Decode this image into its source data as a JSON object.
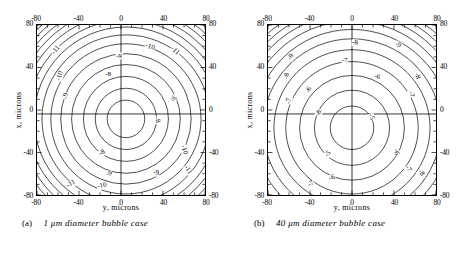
{
  "figure": {
    "panels": [
      {
        "id": "panel-a",
        "caption_tag": "(a)",
        "caption_text": "1 μm diameter bubble case",
        "axis": {
          "xlabel": "y, microns",
          "ylabel": "x, microns",
          "xticks": [
            "-80",
            "-40",
            "0",
            "40",
            "80"
          ],
          "yticks": [
            "80",
            "40",
            "0",
            "-40",
            "-80"
          ],
          "xlim": [
            -80,
            80
          ],
          "ylim": [
            -80,
            80
          ]
        },
        "contour_labels": [
          {
            "text": "-11",
            "x": -62,
            "y": 57,
            "rot": -50
          },
          {
            "text": "-10",
            "x": -58,
            "y": 33,
            "rot": -72
          },
          {
            "text": "-9",
            "x": -53,
            "y": 14,
            "rot": -80
          },
          {
            "text": "-9",
            "x": -3,
            "y": 51,
            "rot": 0
          },
          {
            "text": "-8",
            "x": -13,
            "y": 34,
            "rot": 0
          },
          {
            "text": "-10",
            "x": 26,
            "y": 60,
            "rot": 18
          },
          {
            "text": "-11",
            "x": 50,
            "y": 56,
            "rot": 42
          },
          {
            "text": "-6",
            "x": 48,
            "y": 12,
            "rot": 82
          },
          {
            "text": "-8",
            "x": 33,
            "y": -8,
            "rot": 75
          },
          {
            "text": "-8",
            "x": -19,
            "y": -39,
            "rot": -28
          },
          {
            "text": "-9",
            "x": -12,
            "y": -59,
            "rot": -10
          },
          {
            "text": "-9",
            "x": 32,
            "y": -58,
            "rot": 14
          },
          {
            "text": "-10",
            "x": 58,
            "y": -36,
            "rot": 70
          },
          {
            "text": "-11",
            "x": 62,
            "y": -55,
            "rot": 55
          },
          {
            "text": "-11",
            "x": -48,
            "y": -68,
            "rot": -28
          },
          {
            "text": "-10",
            "x": -19,
            "y": -70,
            "rot": -12
          }
        ],
        "chart_data": {
          "type": "contour",
          "title": "1 μm diameter bubble case",
          "xlabel": "y, microns",
          "ylabel": "x, microns",
          "xlim": [
            -80,
            80
          ],
          "ylim": [
            -80,
            80
          ],
          "levels": [
            -7,
            -8,
            -9,
            -10,
            -11,
            -12,
            -13,
            -14
          ],
          "labeled_levels": [
            -6,
            -8,
            -9,
            -10,
            -11
          ],
          "center": [
            5,
            -4
          ],
          "description": "Concentric near-circular closed contours of decreasing value outward, centered slightly right of and below the origin; contour lines bunch densely at the four corners.",
          "grid": false,
          "legend": "none"
        }
      },
      {
        "id": "panel-b",
        "caption_tag": "(b)",
        "caption_text": "40 μm diameter bubble case",
        "axis": {
          "xlabel": "y, microns",
          "ylabel": "x, microns",
          "xticks": [
            "-80",
            "-40",
            "0",
            "40",
            "80"
          ],
          "yticks": [
            "80",
            "40",
            "0",
            "-40",
            "-80"
          ],
          "xlim": [
            -80,
            80
          ],
          "ylim": [
            -80,
            80
          ]
        },
        "contour_labels": [
          {
            "text": "-9",
            "x": -58,
            "y": 50,
            "rot": -58
          },
          {
            "text": "-8",
            "x": -62,
            "y": 33,
            "rot": -74
          },
          {
            "text": "-7",
            "x": -60,
            "y": 9,
            "rot": -84
          },
          {
            "text": "-6",
            "x": -41,
            "y": 20,
            "rot": -62
          },
          {
            "text": "-8",
            "x": -32,
            "y": -2,
            "rot": -64
          },
          {
            "text": "-8",
            "x": 2,
            "y": 63,
            "rot": 5
          },
          {
            "text": "-7",
            "x": -8,
            "y": 47,
            "rot": 0
          },
          {
            "text": "-9",
            "x": 42,
            "y": 61,
            "rot": 28
          },
          {
            "text": "-6",
            "x": 23,
            "y": 32,
            "rot": 18
          },
          {
            "text": "-8",
            "x": 60,
            "y": 33,
            "rot": 72
          },
          {
            "text": "-7",
            "x": 55,
            "y": 16,
            "rot": 80
          },
          {
            "text": "-5",
            "x": 17,
            "y": -6,
            "rot": 70
          },
          {
            "text": "-5",
            "x": -24,
            "y": -40,
            "rot": -50
          },
          {
            "text": "-6",
            "x": 40,
            "y": -38,
            "rot": 78
          },
          {
            "text": "-7",
            "x": 52,
            "y": -54,
            "rot": 58
          },
          {
            "text": "-8",
            "x": 64,
            "y": -58,
            "rot": 52
          },
          {
            "text": "-6",
            "x": -20,
            "y": -62,
            "rot": -16
          },
          {
            "text": "-7",
            "x": -40,
            "y": -68,
            "rot": -32
          }
        ],
        "chart_data": {
          "type": "contour",
          "title": "40 μm diameter bubble case",
          "xlabel": "y, microns",
          "ylabel": "x, microns",
          "xlim": [
            -80,
            80
          ],
          "ylim": [
            -80,
            80
          ],
          "levels": [
            -5,
            -6,
            -7,
            -8,
            -9,
            -10,
            -11,
            -12
          ],
          "labeled_levels": [
            -5,
            -6,
            -7,
            -8,
            -9
          ],
          "center": [
            0,
            -12
          ],
          "description": "Concentric near-circular closed contours of decreasing value outward, centered slightly below the origin; contour lines bunch densely at the four corners.",
          "grid": false,
          "legend": "none"
        }
      }
    ]
  }
}
